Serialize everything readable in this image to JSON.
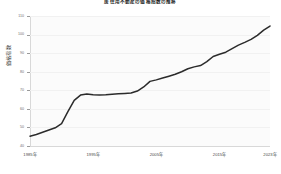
{
  "chart_data": {
    "type": "line",
    "title": "居住用不動産の価格指数の推移",
    "xlabel": "",
    "ylabel": "価格指数",
    "grid": true,
    "legend": "none",
    "xlim": [
      1985,
      2023
    ],
    "ylim": [
      40,
      110
    ],
    "yticks": [
      40,
      50,
      60,
      70,
      80,
      90,
      100,
      110
    ],
    "ytick_labels": [
      "40",
      "50",
      "60",
      "70",
      "80",
      "90",
      "100",
      "110"
    ],
    "xticks": [
      1985,
      1995,
      2005,
      2015,
      2023
    ],
    "xtick_labels": [
      "1985年",
      "1995年",
      "2005年",
      "2015年",
      "2023年"
    ],
    "series": [
      {
        "name": "価格指数",
        "color": "#2b2b2b",
        "x": [
          1985,
          1986,
          1987,
          1988,
          1989,
          1990,
          1991,
          1992,
          1993,
          1994,
          1995,
          1996,
          1997,
          1998,
          1999,
          2000,
          2001,
          2002,
          2003,
          2004,
          2005,
          2006,
          2007,
          2008,
          2009,
          2010,
          2011,
          2012,
          2013,
          2014,
          2015,
          2016,
          2017,
          2018,
          2019,
          2020,
          2021,
          2022,
          2023
        ],
        "values": [
          45.3,
          46.2,
          47.4,
          48.6,
          49.8,
          52.0,
          58.5,
          64.6,
          67.4,
          68.0,
          67.6,
          67.4,
          67.6,
          67.9,
          68.1,
          68.3,
          68.5,
          69.6,
          71.8,
          74.8,
          75.6,
          76.6,
          77.6,
          78.6,
          80.0,
          81.6,
          82.6,
          83.3,
          85.4,
          88.2,
          89.4,
          90.5,
          92.4,
          94.3,
          95.8,
          97.4,
          99.6,
          102.4,
          104.6
        ]
      }
    ]
  }
}
